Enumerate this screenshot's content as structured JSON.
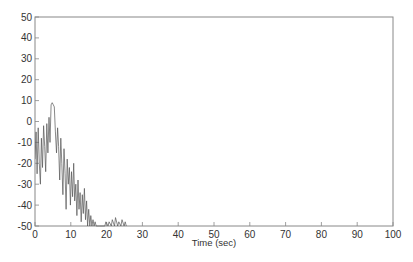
{
  "chart_data": {
    "type": "line",
    "title": "",
    "xlabel": "Time (sec)",
    "ylabel": "",
    "xlim": [
      0,
      100
    ],
    "ylim": [
      -50,
      50
    ],
    "xticks": [
      0,
      10,
      20,
      30,
      40,
      50,
      60,
      70,
      80,
      90,
      100
    ],
    "yticks": [
      50,
      40,
      30,
      20,
      10,
      0,
      -10,
      -20,
      -30,
      -40,
      -50
    ],
    "grid": false,
    "legend": null,
    "line_color": "#555555",
    "series": [
      {
        "name": "signal",
        "x": [
          0,
          0.3,
          0.6,
          0.9,
          1.2,
          1.5,
          1.8,
          2.1,
          2.4,
          2.7,
          3.0,
          3.3,
          3.6,
          3.9,
          4.2,
          4.5,
          4.8,
          5.1,
          5.4,
          5.7,
          6.0,
          6.3,
          6.6,
          6.9,
          7.2,
          7.5,
          7.8,
          8.1,
          8.4,
          8.7,
          9.0,
          9.3,
          9.6,
          9.9,
          10.2,
          10.5,
          10.8,
          11.1,
          11.4,
          11.7,
          12.0,
          12.3,
          12.6,
          12.9,
          13.2,
          13.5,
          13.8,
          14.1,
          14.4,
          14.7,
          15.0,
          15.3,
          15.6,
          15.9,
          16.2,
          16.5,
          16.8,
          17.1,
          17.4,
          17.7,
          18.0,
          19.5,
          19.8,
          20.4,
          20.7,
          21.3,
          21.6,
          22.2,
          22.5,
          23.1,
          23.4,
          24.0,
          24.3,
          24.9,
          25.2,
          25.5
        ],
        "y": [
          -18,
          -5,
          -25,
          -3,
          -20,
          -30,
          -8,
          -22,
          -2,
          -12,
          -24,
          -1,
          -15,
          2,
          -10,
          8,
          9,
          8,
          7,
          -5,
          -15,
          -3,
          -12,
          -28,
          -8,
          -20,
          -35,
          -13,
          -25,
          -42,
          -18,
          -30,
          -22,
          -40,
          -24,
          -36,
          -20,
          -38,
          -30,
          -45,
          -28,
          -42,
          -34,
          -48,
          -35,
          -44,
          -32,
          -47,
          -38,
          -50,
          -42,
          -50,
          -45,
          -50,
          -47,
          -50,
          -48,
          -50,
          -50,
          -50,
          -50,
          -50,
          -48,
          -50,
          -48,
          -50,
          -47,
          -50,
          -46,
          -50,
          -48,
          -50,
          -47,
          -50,
          -48,
          -50
        ]
      }
    ]
  }
}
